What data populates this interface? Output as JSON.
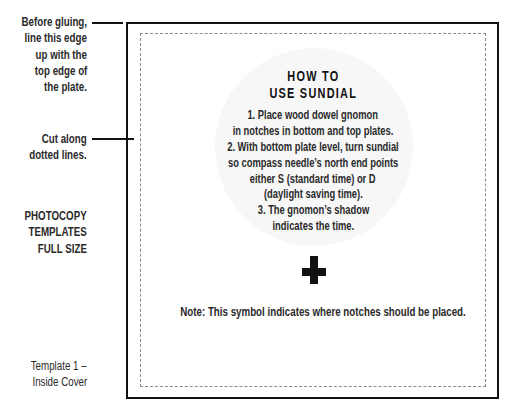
{
  "side_notes": {
    "gluing": [
      "Before gluing,",
      "line this edge",
      "up with the",
      "top edge of",
      "the plate."
    ],
    "cut": [
      "Cut along",
      "dotted lines."
    ],
    "photocopy": [
      "PHOTOCOPY",
      "TEMPLATES",
      "FULL SIZE"
    ],
    "template": [
      "Template 1 –",
      "Inside Cover"
    ]
  },
  "template": {
    "title": [
      "HOW TO",
      "USE SUNDIAL"
    ],
    "instructions": [
      "1. Place wood dowel gnomon",
      "in notches in bottom and top plates.",
      "2. With bottom plate level, turn sundial",
      "so compass needle’s north end points",
      "either S (standard time) or D",
      "(daylight saving time).",
      "3. The gnomon’s shadow",
      "indicates the time."
    ],
    "notch_symbol": "plus-cross-icon",
    "note": "Note: This symbol indicates where notches should be placed."
  },
  "colors": {
    "ink": "#111111",
    "cut_line": "#8a8a8a",
    "circle_bg": "#f7f7f7"
  }
}
